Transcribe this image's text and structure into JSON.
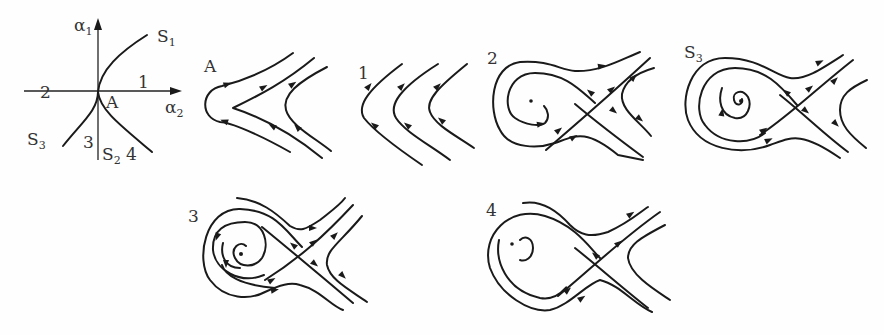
{
  "figure": {
    "bifurcation_diagram": {
      "y_axis": {
        "symbol": "α",
        "sub": "1"
      },
      "x_axis": {
        "symbol": "α",
        "sub": "2"
      },
      "point": "A",
      "curves": [
        {
          "name": "S",
          "sub": "1"
        },
        {
          "name": "S",
          "sub": "2"
        },
        {
          "name": "S",
          "sub": "3"
        }
      ],
      "regions": [
        "1",
        "2",
        "3",
        "4"
      ]
    },
    "phase_portraits": [
      {
        "label": "A"
      },
      {
        "label": "1"
      },
      {
        "label": "2"
      },
      {
        "label": "S",
        "sub": "3"
      },
      {
        "label": "3"
      },
      {
        "label": "4"
      }
    ]
  }
}
